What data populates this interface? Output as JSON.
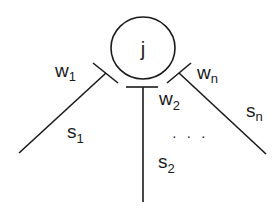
{
  "diagram": {
    "type": "neuron-synapse-diagram",
    "node": {
      "label": "j",
      "shape": "circle"
    },
    "connections": [
      {
        "weight": {
          "base": "w",
          "sub": "1"
        },
        "input": {
          "base": "s",
          "sub": "1"
        },
        "direction": "lower-left"
      },
      {
        "weight": {
          "base": "w",
          "sub": "2"
        },
        "input": {
          "base": "s",
          "sub": "2"
        },
        "direction": "down"
      },
      {
        "weight": {
          "base": "w",
          "sub": "n"
        },
        "input": {
          "base": "s",
          "sub": "n"
        },
        "direction": "lower-right"
      }
    ],
    "ellipsis": "· · ·",
    "colors": {
      "stroke": "#1a1a1a",
      "background": "#ffffff"
    }
  }
}
